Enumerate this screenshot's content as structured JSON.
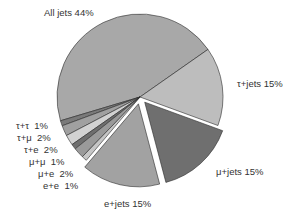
{
  "chart_data": {
    "type": "pie",
    "title": "",
    "slices": [
      {
        "label": "All jets",
        "value": 44,
        "color": "#a8a8a8",
        "explode": 0
      },
      {
        "label": "τ+τ",
        "value": 1,
        "color": "#7a7a7a",
        "explode": 0
      },
      {
        "label": "τ+μ",
        "value": 2,
        "color": "#a0a0a0",
        "explode": 0
      },
      {
        "label": "τ+e",
        "value": 2,
        "color": "#d2d2d2",
        "explode": 0
      },
      {
        "label": "μ+μ",
        "value": 1,
        "color": "#6e6e6e",
        "explode": 0
      },
      {
        "label": "μ+e",
        "value": 2,
        "color": "#9a9a9a",
        "explode": 0
      },
      {
        "label": "e+e",
        "value": 1,
        "color": "#c6c6c6",
        "explode": 0
      },
      {
        "label": "e+jets",
        "value": 15,
        "color": "#a2a2a2",
        "explode": 7
      },
      {
        "label": "μ+jets",
        "value": 15,
        "color": "#6f6f6f",
        "explode": 7
      },
      {
        "label": "τ+jets",
        "value": 15,
        "color": "#bdbdbd",
        "explode": 0
      }
    ],
    "labels_text": [
      "All jets 44%",
      "τ+τ  1%",
      "τ+μ  2%",
      "τ+e  2%",
      "μ+μ  1%",
      "μ+e  2%",
      "e+e  1%",
      "e+jets 15%",
      "μ+jets 15%",
      "τ+jets 15%"
    ],
    "legend": "none",
    "start_angle_deg": 35,
    "direction": "counterclockwise"
  },
  "labels": {
    "all_jets": "All jets 44%",
    "tau_jets": "τ+jets 15%",
    "mu_jets": "μ+jets 15%",
    "e_jets": "e+jets 15%",
    "tau_tau": "τ+τ  1%",
    "tau_mu": "τ+μ  2%",
    "tau_e": "τ+e  2%",
    "mu_mu": "μ+μ  1%",
    "mu_e": "μ+e  2%",
    "e_e": "e+e  1%"
  }
}
